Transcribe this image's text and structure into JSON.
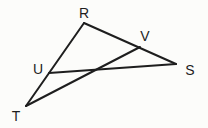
{
  "diagram": {
    "type": "geometry-triangle",
    "stroke_color": "#1e1e1e",
    "points": {
      "R": {
        "label": "R",
        "x": 84,
        "y": 23,
        "lx": 84,
        "ly": 18
      },
      "V": {
        "label": "V",
        "x": 140,
        "y": 47,
        "lx": 145,
        "ly": 41
      },
      "S": {
        "label": "S",
        "x": 176,
        "y": 64,
        "lx": 190,
        "ly": 75
      },
      "U": {
        "label": "U",
        "x": 49,
        "y": 73,
        "lx": 38,
        "ly": 74
      },
      "T": {
        "label": "T",
        "x": 26,
        "y": 106,
        "lx": 16,
        "ly": 121
      }
    },
    "segments": [
      {
        "from": "R",
        "to": "S"
      },
      {
        "from": "R",
        "to": "T"
      },
      {
        "from": "U",
        "to": "S"
      },
      {
        "from": "T",
        "to": "V"
      }
    ]
  }
}
